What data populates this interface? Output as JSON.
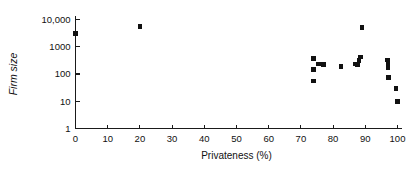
{
  "chart_data": {
    "type": "scatter",
    "title": "",
    "xlabel": "Privateness (%)",
    "ylabel": "Firm size",
    "xlim": [
      0,
      100
    ],
    "ylim": [
      1,
      10000
    ],
    "yscale": "log",
    "xscale": "linear",
    "grid": false,
    "legend": null,
    "xticks": [
      0,
      10,
      20,
      30,
      40,
      50,
      60,
      70,
      80,
      90,
      100
    ],
    "xticklabels": [
      "0",
      "10",
      "20",
      "30",
      "40",
      "50",
      "60",
      "70",
      "80",
      "90",
      "100"
    ],
    "yticks": [
      1,
      10,
      100,
      1000,
      10000
    ],
    "yticklabels": [
      "1",
      "10",
      "100",
      "1000",
      "10,000"
    ],
    "marker": "square",
    "marker_color": "#111111",
    "points": [
      {
        "x": 0,
        "y": 3000
      },
      {
        "x": 20,
        "y": 5500
      },
      {
        "x": 74,
        "y": 370
      },
      {
        "x": 74,
        "y": 150
      },
      {
        "x": 74,
        "y": 55
      },
      {
        "x": 75.5,
        "y": 230
      },
      {
        "x": 77,
        "y": 225
      },
      {
        "x": 82.5,
        "y": 190
      },
      {
        "x": 87,
        "y": 230
      },
      {
        "x": 87.5,
        "y": 220
      },
      {
        "x": 88,
        "y": 310
      },
      {
        "x": 88.5,
        "y": 420
      },
      {
        "x": 89,
        "y": 5000
      },
      {
        "x": 96.8,
        "y": 330
      },
      {
        "x": 97,
        "y": 280
      },
      {
        "x": 97,
        "y": 240
      },
      {
        "x": 97,
        "y": 200
      },
      {
        "x": 97,
        "y": 170
      },
      {
        "x": 97.2,
        "y": 75
      },
      {
        "x": 99.5,
        "y": 30
      },
      {
        "x": 100,
        "y": 10
      }
    ]
  },
  "axes": {
    "x_title": "Privateness (%)",
    "y_title": "Firm size"
  }
}
